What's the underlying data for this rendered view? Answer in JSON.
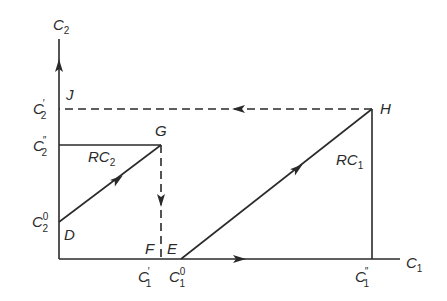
{
  "axes": {
    "x_label": "C",
    "x_sub": "1",
    "y_label": "C",
    "y_sub": "2"
  },
  "points": {
    "J": "J",
    "G": "G",
    "H": "H",
    "D": "D",
    "F": "F",
    "E": "E"
  },
  "y_ticks": [
    {
      "base": "C",
      "sub": "2",
      "sup": "′"
    },
    {
      "base": "C",
      "sub": "2",
      "sup": "″"
    },
    {
      "base": "C",
      "sub": "2",
      "sup": "0"
    }
  ],
  "x_ticks": [
    {
      "base": "C",
      "sub": "1",
      "sup": "′"
    },
    {
      "base": "C",
      "sub": "1",
      "sup": "0"
    },
    {
      "base": "C",
      "sub": "1",
      "sup": "″"
    }
  ],
  "lines": {
    "rc2": {
      "base": "RC",
      "sub": "2"
    },
    "rc1": {
      "base": "RC",
      "sub": "1"
    }
  },
  "colors": {
    "stroke": "#2a2a2a"
  }
}
